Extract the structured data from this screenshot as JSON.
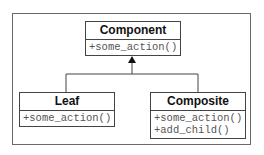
{
  "diagram": {
    "type": "uml-class-diagram",
    "classes": [
      {
        "id": "component",
        "name": "Component",
        "operations": [
          "+some_action()"
        ]
      },
      {
        "id": "leaf",
        "name": "Leaf",
        "operations": [
          "+some_action()"
        ]
      },
      {
        "id": "composite",
        "name": "Composite",
        "operations": [
          "+some_action()",
          "+add_child()"
        ]
      }
    ],
    "relationships": [
      {
        "type": "generalization",
        "from": "Leaf",
        "to": "Component"
      },
      {
        "type": "generalization",
        "from": "Composite",
        "to": "Component"
      }
    ],
    "colors": {
      "line": "#444444",
      "frame": "#6a6a6a",
      "title_text": "#111111",
      "operation_text": "#555555"
    }
  }
}
